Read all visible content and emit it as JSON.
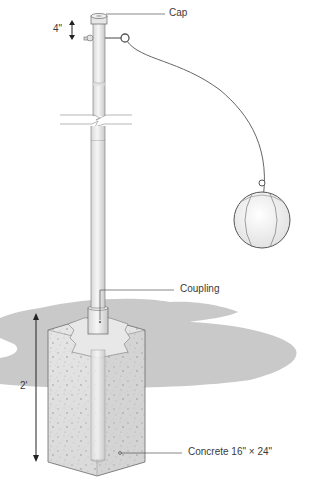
{
  "diagram": {
    "labels": {
      "cap": "Cap",
      "coupling": "Coupling",
      "concrete": "Concrete 16\" × 24\"",
      "cap_height": "4\"",
      "depth": "2'"
    },
    "colors": {
      "ground": "#c9c9c9",
      "concrete": "#e4e4e4",
      "concrete_side": "#d6d6d6",
      "pole": "#e9e9e9",
      "outline": "#555555",
      "rope": "#666666",
      "leader": "#555555",
      "text": "#3a3a3a"
    }
  }
}
